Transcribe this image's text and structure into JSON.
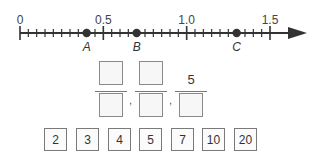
{
  "number_line": {
    "start": 0,
    "end": 1.5,
    "minor_step": 0.05,
    "labels": [
      {
        "value": 0,
        "text": "0"
      },
      {
        "value": 0.5,
        "text": "0.5"
      },
      {
        "value": 1.0,
        "text": "1.0"
      },
      {
        "value": 1.5,
        "text": "1.5"
      }
    ],
    "points": [
      {
        "name": "A",
        "value": 0.4
      },
      {
        "name": "B",
        "value": 0.7
      },
      {
        "name": "C",
        "value": 1.3
      }
    ],
    "arrow": "right-arrow",
    "color": "#333333"
  },
  "fractions": [
    {
      "numerator": "",
      "denominator": ""
    },
    {
      "numerator": "",
      "denominator": ""
    },
    {
      "numerator": "5",
      "denominator": ""
    }
  ],
  "separators": [
    ",",
    ","
  ],
  "tiles": [
    "2",
    "3",
    "4",
    "5",
    "7",
    "10",
    "20"
  ]
}
